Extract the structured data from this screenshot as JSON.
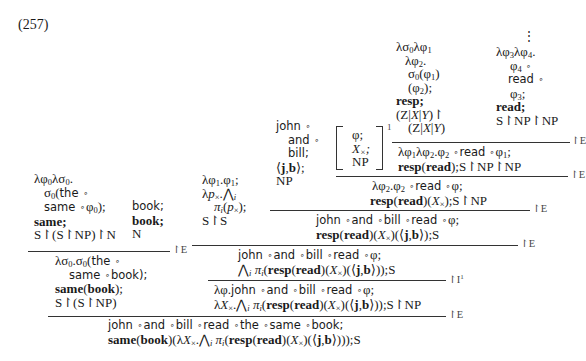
{
  "example_number": "(257)",
  "proof": {
    "leaf_resp": {
      "lines": [
        "λσ₀λφ₁",
        "λφ₂.",
        "σ₀(φ₁)",
        "(φ₂);",
        "resp;",
        "(Z|X|Y)↾",
        "(Z|X|Y)"
      ]
    },
    "leaf_read": {
      "dots": "⋮",
      "lines": [
        "λφ₃λφ₄.",
        "φ₄ ∘",
        "read ∘",
        "φ₃;",
        "read;",
        "S↾NP↾NP"
      ]
    },
    "step_resp_read": {
      "lines": [
        "λφ₁λφ₂.φ₂ ∘ read ∘ φ₁;",
        "resp(read);S↾NP↾NP"
      ],
      "rule": "↾E"
    },
    "hypothesis": {
      "lines": [
        "φ;",
        "X×;",
        "NP"
      ],
      "index": "1"
    },
    "step_resp_read_x": {
      "lines": [
        "λφ₂.φ₂ ∘ read ∘ φ;",
        "resp(read)(X×);S↾NP"
      ],
      "rule": "↾E"
    },
    "leaf_jb": {
      "lines": [
        "john ∘",
        "and ∘",
        "bill;",
        "⟨j,b⟩;",
        "NP"
      ]
    },
    "step_jb_read": {
      "lines": [
        "john ∘ and ∘ bill ∘ read ∘ φ;",
        "resp(read)(X×)(⟨j,b⟩);S"
      ],
      "rule": "↾E"
    },
    "leaf_pi": {
      "lines": [
        "λφ₁.φ₁;",
        "λp×.⋀ᵢ",
        "πᵢ(p×);",
        "S↾S"
      ]
    },
    "step_pi": {
      "lines": [
        "john ∘ and ∘ bill ∘ read ∘ φ;",
        "⋀ᵢ πᵢ(resp(read)(X×)(⟨j,b⟩));S"
      ],
      "rule": "↾E"
    },
    "step_abstract": {
      "lines": [
        "λφ.john ∘ and ∘ bill ∘ read ∘ φ;",
        "λX×.⋀ᵢ πᵢ(resp(read)(X×)(⟨j,b⟩));S↾NP"
      ],
      "rule": "↾I¹"
    },
    "leaf_same": {
      "lines": [
        "λφ₀λσ₀.",
        "σ₀(the ∘",
        "same ∘ φ₀);",
        "same;",
        "S↾(S↾NP)↾N"
      ]
    },
    "leaf_book": {
      "lines": [
        "book;",
        "book;",
        "N"
      ]
    },
    "step_same_book": {
      "lines": [
        "λσ₀.σ₀(the ∘",
        "same ∘ book);",
        "same(book);",
        "S↾(S↾NP)"
      ],
      "rule": "↾E"
    },
    "conclusion": {
      "lines": [
        "john ∘ and ∘ bill ∘ read ∘ the ∘ same ∘ book;",
        "same(book)(λX×.⋀ᵢ πᵢ(resp(read)(X×)(⟨j,b⟩)));S"
      ],
      "rule": "↾E"
    }
  }
}
